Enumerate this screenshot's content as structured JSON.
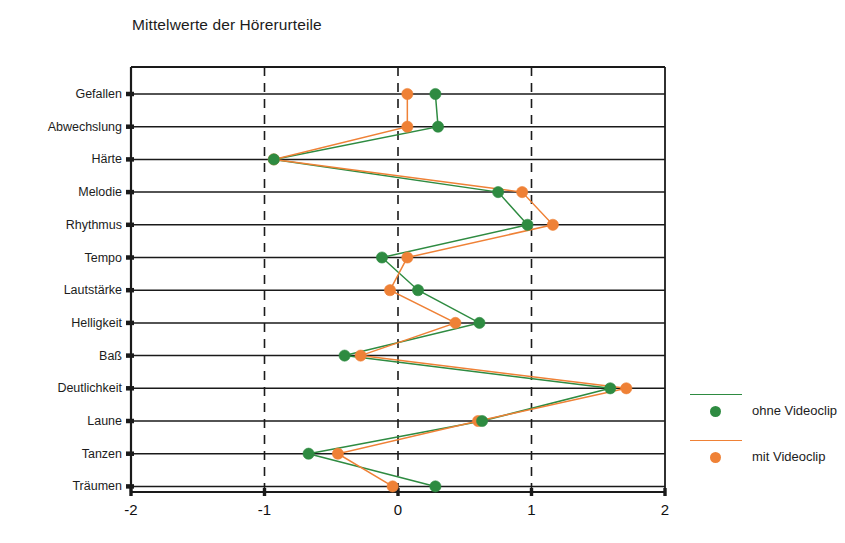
{
  "chart_data": {
    "type": "line",
    "title": "Mittelwerte der Hörerurteile",
    "orientation": "horizontal",
    "xlabel": "",
    "ylabel": "",
    "xlim": [
      -2,
      2
    ],
    "xticks": [
      -2,
      -1,
      0,
      1,
      2
    ],
    "xtick_labels": [
      "-2",
      "-1",
      "0",
      "1",
      "2"
    ],
    "grid": "vertical-dashed-and-horizontal-solid",
    "legend_position": "right",
    "categories": [
      "Gefallen",
      "Abwechslung",
      "Härte",
      "Melodie",
      "Rhythmus",
      "Tempo",
      "Lautstärke",
      "Helligkeit",
      "Baß",
      "Deutlichkeit",
      "Laune",
      "Tanzen",
      "Träumen"
    ],
    "series": [
      {
        "name": "ohne Videoclip",
        "color": "#2e8b41",
        "values": [
          0.28,
          0.3,
          -0.93,
          0.75,
          0.97,
          -0.12,
          0.15,
          0.61,
          -0.4,
          1.59,
          0.63,
          -0.67,
          0.28
        ]
      },
      {
        "name": "mit Videoclip",
        "color": "#ef8136",
        "values": [
          0.07,
          0.07,
          -0.93,
          0.93,
          1.16,
          0.07,
          -0.06,
          0.43,
          -0.28,
          1.71,
          0.6,
          -0.45,
          -0.04
        ]
      }
    ]
  },
  "legend": {
    "items": [
      {
        "label": "ohne Videoclip",
        "color": "#2e8b41"
      },
      {
        "label": "mit Videoclip",
        "color": "#ef8136"
      }
    ]
  },
  "colors": {
    "series_green": "#2e8b41",
    "series_orange": "#ef8136",
    "axis": "#1a1a1a",
    "background": "#ffffff"
  }
}
